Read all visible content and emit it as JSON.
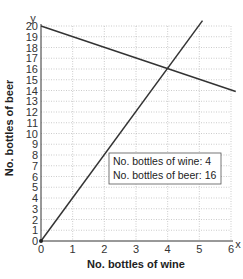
{
  "chart_data": {
    "type": "line",
    "title": "",
    "xlabel": "No. bottles of wine",
    "ylabel": "No. bottles of beer",
    "x_axis_letter": "x",
    "y_axis_letter": "y",
    "xlim": [
      0,
      6
    ],
    "ylim": [
      0,
      20
    ],
    "x_ticks": [
      0,
      1,
      2,
      3,
      4,
      5,
      6
    ],
    "y_ticks": [
      0,
      1,
      2,
      3,
      4,
      5,
      6,
      7,
      8,
      9,
      10,
      11,
      12,
      13,
      14,
      15,
      16,
      17,
      18,
      19,
      20
    ],
    "grid": true,
    "series": [
      {
        "name": "rising line",
        "x": [
          0,
          5.1
        ],
        "y": [
          0,
          20.5
        ]
      },
      {
        "name": "falling line",
        "x": [
          0,
          6.15
        ],
        "y": [
          20,
          13.9
        ]
      }
    ],
    "intersection": {
      "x": 4,
      "y": 16
    },
    "annotation": {
      "line1": "No. bottles of wine: 4",
      "line2": "No. bottles of beer: 16"
    }
  }
}
